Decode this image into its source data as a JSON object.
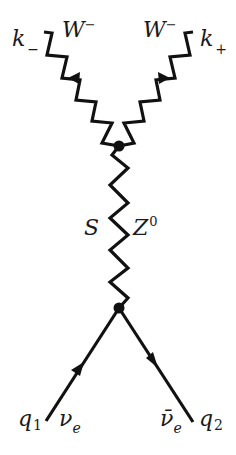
{
  "diagram": {
    "type": "feynman",
    "colors": {
      "line": "#111111",
      "background": "#ffffff"
    },
    "labels": {
      "k_minus": {
        "base": "k",
        "sub": "−"
      },
      "k_plus": {
        "base": "k",
        "sub": "+"
      },
      "w_left": {
        "base": "W",
        "sup": "−"
      },
      "w_right": {
        "base": "W",
        "sup": "−"
      },
      "s": "S",
      "z0": {
        "base": "Z",
        "sup": "0"
      },
      "q1": {
        "base": "q",
        "sub": "1"
      },
      "q2": {
        "base": "q",
        "sub": "2"
      },
      "nu_e": {
        "base": "ν",
        "sub": "e"
      },
      "nu_e_bar": {
        "base": "ν̄",
        "sub": "e"
      }
    },
    "vertices": [
      {
        "name": "upper-vertex",
        "x": 119,
        "y": 145
      },
      {
        "name": "lower-vertex",
        "x": 119,
        "y": 308
      }
    ],
    "propagators": [
      {
        "name": "w-boson-left",
        "kind": "zigzag",
        "arrow": "toward-vertex-up-left"
      },
      {
        "name": "w-boson-right",
        "kind": "zigzag",
        "arrow": "away-right"
      },
      {
        "name": "z0-boson",
        "kind": "zigzag-vertical"
      },
      {
        "name": "neutrino-in",
        "kind": "fermion",
        "arrow": "up"
      },
      {
        "name": "antineutrino-out",
        "kind": "fermion",
        "arrow": "down"
      }
    ]
  }
}
